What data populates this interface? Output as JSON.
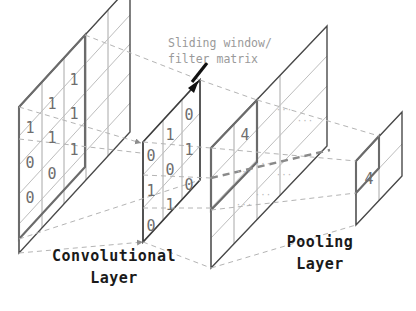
{
  "figure": {
    "annotation": {
      "line1": "Sliding window/",
      "line2": "filter matrix",
      "color": "#9e9e9e"
    },
    "labels": {
      "conv_line1": "Convolutional",
      "conv_line2": "Layer",
      "pool_line1": "Pooling",
      "pool_line2": "Layer"
    },
    "colors": {
      "plane_outline": "#4a4a4a",
      "grid_line": "#a8a8a8",
      "highlight": "#6b6b6b",
      "dashed_projection": "#b0b0b0",
      "digit": "#6e6e6e",
      "arrow": "#111111",
      "label": "#1a1a1a",
      "background": "#ffffff"
    }
  },
  "input_plane": {
    "name": "input-feature-map",
    "rows": 5,
    "cols": 5,
    "digits": [
      {
        "value": "1",
        "x": 30,
        "y": 133
      },
      {
        "value": "1",
        "x": 52,
        "y": 109
      },
      {
        "value": "1",
        "x": 74,
        "y": 85
      },
      {
        "value": "0",
        "x": 30,
        "y": 168
      },
      {
        "value": "1",
        "x": 52,
        "y": 143
      },
      {
        "value": "1",
        "x": 74,
        "y": 119
      },
      {
        "value": "0",
        "x": 30,
        "y": 203
      },
      {
        "value": "0",
        "x": 52,
        "y": 179
      },
      {
        "value": "1",
        "x": 74,
        "y": 155
      }
    ],
    "highlight_window": {
      "rows": 3,
      "cols": 3
    }
  },
  "filter_plane": {
    "name": "sliding-window-filter-matrix",
    "rows": 3,
    "cols": 3,
    "digits": [
      {
        "value": "0",
        "x": 151,
        "y": 161
      },
      {
        "value": "1",
        "x": 170,
        "y": 140
      },
      {
        "value": "0",
        "x": 189,
        "y": 120
      },
      {
        "value": "1",
        "x": 151,
        "y": 196
      },
      {
        "value": "0",
        "x": 170,
        "y": 175
      },
      {
        "value": "1",
        "x": 189,
        "y": 155
      },
      {
        "value": "0",
        "x": 151,
        "y": 231
      },
      {
        "value": "1",
        "x": 170,
        "y": 210
      },
      {
        "value": "0",
        "x": 189,
        "y": 190
      }
    ]
  },
  "pooling_plane": {
    "name": "pooling-feature-map",
    "rows": 4,
    "cols": 4,
    "digits": [
      {
        "value": "4",
        "x": 245,
        "y": 140
      }
    ],
    "dots": [
      {
        "value": "···",
        "x": 284,
        "y": 113
      },
      {
        "value": "···",
        "x": 305,
        "y": 124
      },
      {
        "value": "···",
        "x": 263,
        "y": 167
      },
      {
        "value": "···",
        "x": 284,
        "y": 178
      },
      {
        "value": "···",
        "x": 244,
        "y": 175
      },
      {
        "value": "···",
        "x": 244,
        "y": 208
      },
      {
        "value": "···",
        "x": 263,
        "y": 198
      }
    ]
  },
  "output_plane": {
    "name": "pooled-output-map",
    "rows": 2,
    "cols": 2,
    "digits": [
      {
        "value": "4",
        "x": 369,
        "y": 184
      }
    ]
  }
}
